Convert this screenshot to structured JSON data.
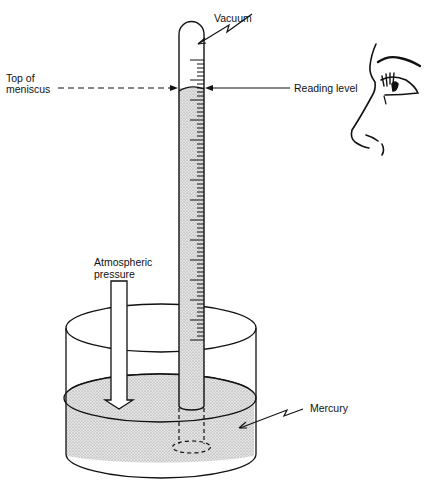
{
  "diagram": {
    "labels": {
      "vacuum": "Vacuum",
      "top_of_meniscus_line1": "Top of",
      "top_of_meniscus_line2": "meniscus",
      "reading_level": "Reading level",
      "atmospheric_pressure_line1": "Atmospheric",
      "atmospheric_pressure_line2": "pressure",
      "mercury": "Mercury"
    },
    "components": [
      "glass-tube",
      "vacuum-space",
      "mercury-column",
      "graduated-scale",
      "mercury-reservoir",
      "atmospheric-pressure-arrow",
      "observer-eye"
    ],
    "colors": {
      "line": "#111111",
      "mercury_fill": "#d8d8d8",
      "background": "#ffffff"
    }
  }
}
